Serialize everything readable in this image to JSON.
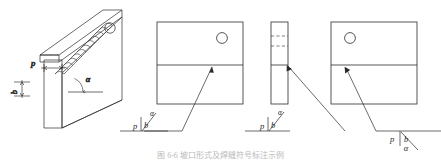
{
  "figure": {
    "caption": "图 6-6  坡口形式及焊缝符号标注示例",
    "stroke_color": "#2b2b2b",
    "bead_color": "#3a3a3a",
    "panels": [
      {
        "id": "isometric-joint",
        "name": "isometric-welded-joint",
        "labels": {
          "gap": "p",
          "root": "b",
          "angle": "α"
        },
        "detail_marker": "circle"
      },
      {
        "id": "front-view-left",
        "name": "front-view-plate-right-circle",
        "labels": {
          "gap": "p",
          "root": "b",
          "angle": "α"
        },
        "detail_marker": "circle",
        "marker_position": "upper-right"
      },
      {
        "id": "edge-view-strip",
        "name": "edge-view-plate-strip",
        "labels": {
          "gap": "p",
          "root": "b",
          "angle": "α"
        }
      },
      {
        "id": "front-view-right",
        "name": "front-view-plate-left-circle",
        "labels": {
          "gap": "p",
          "root": "b",
          "angle": "α"
        },
        "detail_marker": "circle",
        "marker_position": "upper-left"
      }
    ]
  }
}
